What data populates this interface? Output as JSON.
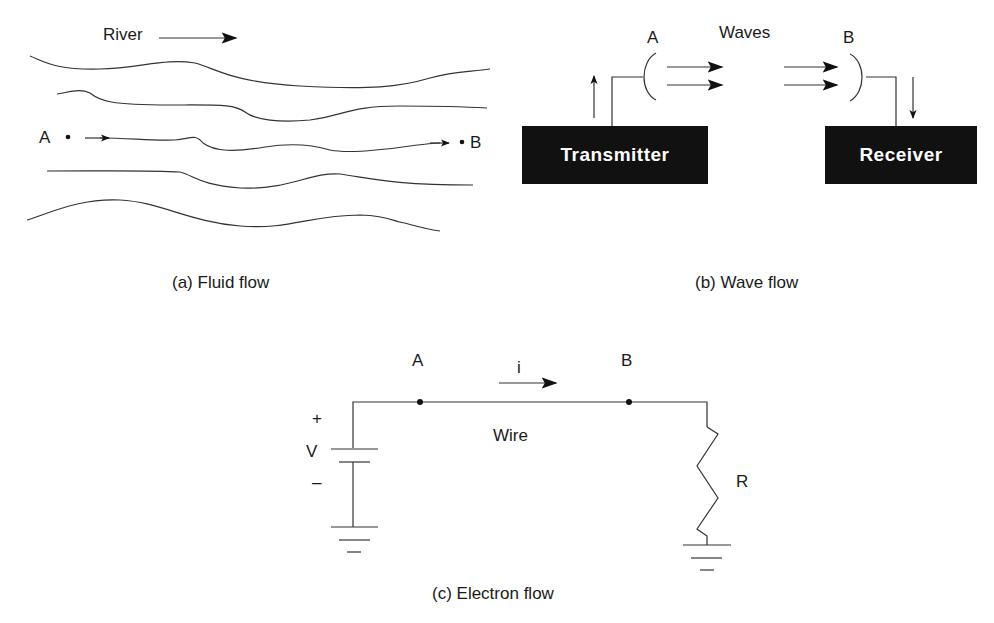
{
  "panels": {
    "fluid": {
      "caption": "(a) Fluid flow",
      "river_label": "River",
      "point_a": "A",
      "point_b": "B"
    },
    "wave": {
      "caption": "(b) Wave flow",
      "waves_label": "Waves",
      "point_a": "A",
      "point_b": "B",
      "transmitter_label": "Transmitter",
      "receiver_label": "Receiver"
    },
    "electron": {
      "caption": "(c) Electron flow",
      "point_a": "A",
      "point_b": "B",
      "current_label": "i",
      "wire_label": "Wire",
      "plus_sign": "+",
      "minus_sign": "–",
      "voltage_label": "V",
      "resistor_label": "R"
    }
  },
  "colors": {
    "line": "#333333",
    "box_fill": "#111111",
    "box_text": "#ffffff"
  }
}
